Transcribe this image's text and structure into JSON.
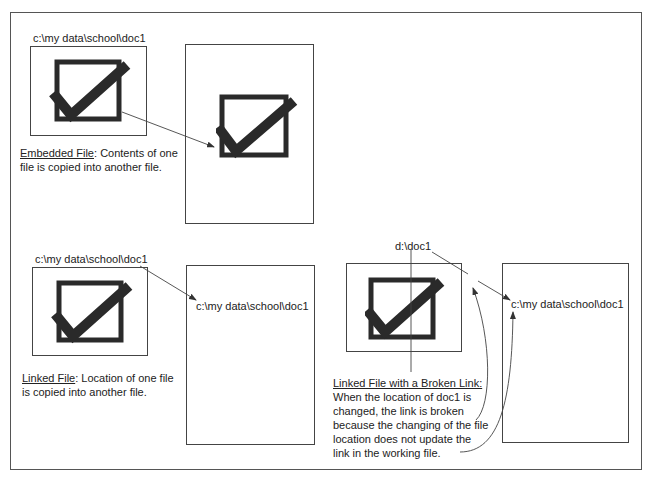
{
  "embedded": {
    "source_path": "c:\\my data\\school\\doc1",
    "caption_title": "Embedded File",
    "caption_sep": ": ",
    "caption_line1": "Contents of one",
    "caption_line2": "file is copied into another file."
  },
  "linked": {
    "source_path": "c:\\my data\\school\\doc1",
    "target_path": "c:\\my data\\school\\doc1",
    "caption_title": "Linked File",
    "caption_sep": ": ",
    "caption_line1": "Location of one file",
    "caption_line2": "is copied into another file."
  },
  "broken": {
    "source_path": "d:\\doc1",
    "target_path": "c:\\my data\\school\\doc1",
    "caption_title": "Linked File with a Broken Link:",
    "caption_lines": [
      "When the location of doc1 is",
      "changed, the link is broken",
      "because the changing of the file",
      "location does not update the",
      "link in the working file."
    ]
  },
  "icons": {
    "checkmark": "checkbox-checkmark-icon"
  },
  "colors": {
    "ink": "#222222",
    "line": "#444444",
    "background": "#ffffff"
  }
}
